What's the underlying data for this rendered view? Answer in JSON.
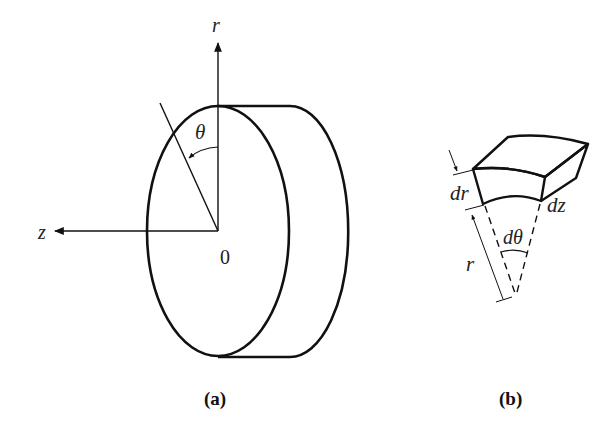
{
  "figure": {
    "panel_a": {
      "caption": "(a)",
      "axis_r_label": "r",
      "axis_z_label": "z",
      "origin_label": "0",
      "angle_label": "θ"
    },
    "panel_b": {
      "caption": "(b)",
      "dr_label": "dr",
      "dz_label": "dz",
      "dtheta_label": "dθ",
      "r_label": "r"
    },
    "colors": {
      "stroke": "#111111",
      "background": "#ffffff"
    }
  }
}
